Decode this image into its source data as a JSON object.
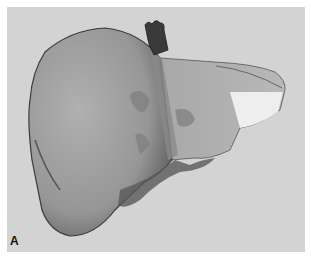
{
  "figure": {
    "panel_label": "A",
    "colors": {
      "background": "#d3d3d3",
      "border": "#ffffff",
      "liver_main": "#9a9a9a",
      "liver_shadow": "#5a5a5a",
      "left_lobe_highlight": "#eeeeee",
      "vessel": "#3a3a3a"
    }
  }
}
